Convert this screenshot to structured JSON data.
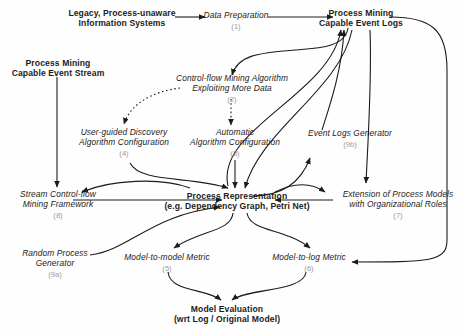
{
  "diagram": {
    "style": {
      "ink": "#1c1c1c",
      "number_color": "#9a9a9a",
      "background": "#fefefe"
    },
    "nodes": [
      {
        "id": "legacy",
        "label_line1": "Legacy, Process-unaware",
        "label_line2": "Information Systems",
        "number": "",
        "emphasis": "bold"
      },
      {
        "id": "dataprep",
        "label_line1": "Data Preparation",
        "label_line2": "",
        "number": "(1)",
        "emphasis": "italic"
      },
      {
        "id": "logs",
        "label_line1": "Process Mining",
        "label_line2": "Capable Event Logs",
        "number": "",
        "emphasis": "bold"
      },
      {
        "id": "stream",
        "label_line1": "Process Mining",
        "label_line2": "Capable Event Stream",
        "number": "",
        "emphasis": "bold"
      },
      {
        "id": "cfmining",
        "label_line1": "Control-flow Mining Algorithm",
        "label_line2": "Exploiting More Data",
        "number": "(2)",
        "emphasis": "italic"
      },
      {
        "id": "userguided",
        "label_line1": "User-guided Discovery",
        "label_line2": "Algorithm Configuration",
        "number": "(4)",
        "emphasis": "italic"
      },
      {
        "id": "automatic",
        "label_line1": "Automatic",
        "label_line2": "Algorithm Configuration",
        "number": "(3)",
        "emphasis": "italic"
      },
      {
        "id": "loggen",
        "label_line1": "Event Logs Generator",
        "label_line2": "",
        "number": "(9b)",
        "emphasis": "italic"
      },
      {
        "id": "streamfw",
        "label_line1": "Stream Control-flow",
        "label_line2": "Mining Framework",
        "number": "(8)",
        "emphasis": "italic"
      },
      {
        "id": "procrep",
        "label_line1": "Process Representation",
        "label_line2": "(e.g. Dependency Graph, Petri Net)",
        "number": "",
        "emphasis": "bold"
      },
      {
        "id": "extension",
        "label_line1": "Extension of Process Models",
        "label_line2": "with Organizational Roles",
        "number": "(7)",
        "emphasis": "italic"
      },
      {
        "id": "randomgen",
        "label_line1": "Random Process",
        "label_line2": "Generator",
        "number": "(9a)",
        "emphasis": "italic"
      },
      {
        "id": "m2m",
        "label_line1": "Model-to-model Metric",
        "label_line2": "",
        "number": "(5)",
        "emphasis": "italic"
      },
      {
        "id": "m2l",
        "label_line1": "Model-to-log Metric",
        "label_line2": "",
        "number": "(6)",
        "emphasis": "italic"
      },
      {
        "id": "modeleval",
        "label_line1": "Model Evaluation",
        "label_line2": "(wrt Log / Original Model)",
        "number": "",
        "emphasis": "bold"
      }
    ],
    "edges": [
      {
        "from": "legacy",
        "to": "dataprep",
        "style": "solid"
      },
      {
        "from": "dataprep",
        "to": "logs",
        "style": "solid"
      },
      {
        "from": "logs",
        "to": "cfmining",
        "style": "solid"
      },
      {
        "from": "cfmining",
        "to": "automatic",
        "style": "dotted"
      },
      {
        "from": "cfmining",
        "to": "userguided",
        "style": "dotted"
      },
      {
        "from": "stream",
        "to": "streamfw",
        "style": "solid"
      },
      {
        "from": "userguided",
        "to": "procrep",
        "style": "solid"
      },
      {
        "from": "automatic",
        "to": "procrep",
        "style": "solid"
      },
      {
        "from": "logs",
        "to": "procrep",
        "style": "solid"
      },
      {
        "from": "procrep",
        "to": "logs",
        "style": "solid"
      },
      {
        "from": "streamfw",
        "to": "procrep",
        "style": "solid"
      },
      {
        "from": "procrep",
        "to": "streamfw",
        "style": "solid"
      },
      {
        "from": "randomgen",
        "to": "procrep",
        "style": "solid"
      },
      {
        "from": "procrep",
        "to": "loggen",
        "style": "solid"
      },
      {
        "from": "loggen",
        "to": "logs",
        "style": "solid"
      },
      {
        "from": "logs",
        "to": "extension",
        "style": "solid"
      },
      {
        "from": "extension",
        "to": "procrep",
        "style": "solid"
      },
      {
        "from": "procrep",
        "to": "extension",
        "style": "solid"
      },
      {
        "from": "procrep",
        "to": "m2m",
        "style": "solid"
      },
      {
        "from": "procrep",
        "to": "m2l",
        "style": "solid"
      },
      {
        "from": "logs",
        "to": "m2l",
        "style": "solid"
      },
      {
        "from": "m2m",
        "to": "modeleval",
        "style": "solid"
      },
      {
        "from": "m2l",
        "to": "modeleval",
        "style": "solid"
      }
    ]
  }
}
